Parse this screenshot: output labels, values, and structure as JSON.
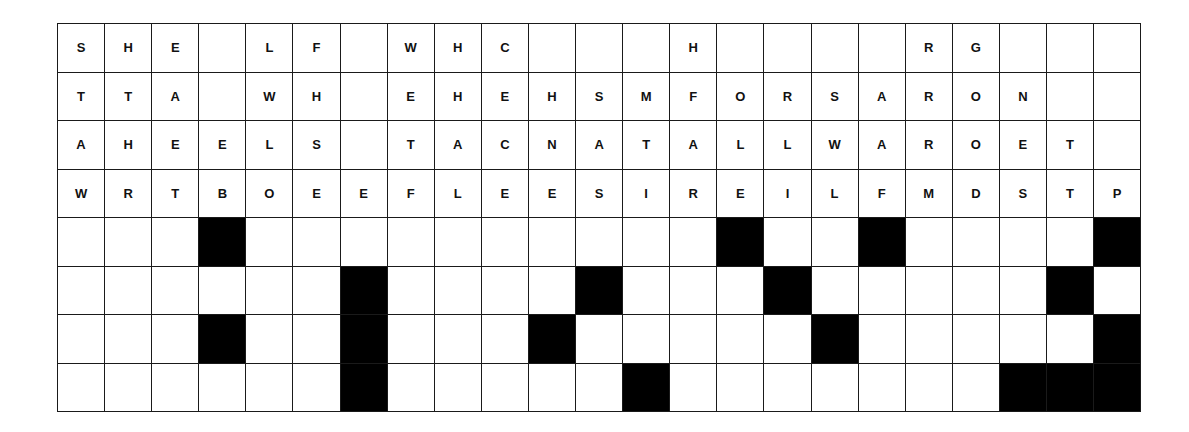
{
  "puzzle": {
    "type": "drop-quote",
    "columns": 23,
    "rows": 8,
    "colors": {
      "grid_line": "#1a1a1a",
      "black_cell": "#000000",
      "white_cell": "#ffffff",
      "letter": "#111111"
    },
    "letter_rows": [
      [
        "S",
        "H",
        "E",
        "",
        "L",
        "F",
        "",
        "W",
        "H",
        "C",
        "",
        "",
        "",
        "H",
        "",
        "",
        "",
        "",
        "R",
        "G",
        "",
        "",
        ""
      ],
      [
        "T",
        "T",
        "A",
        "",
        "W",
        "H",
        "",
        "E",
        "H",
        "E",
        "H",
        "S",
        "M",
        "F",
        "O",
        "R",
        "S",
        "A",
        "R",
        "O",
        "N",
        "",
        ""
      ],
      [
        "A",
        "H",
        "E",
        "E",
        "L",
        "S",
        "",
        "T",
        "A",
        "C",
        "N",
        "A",
        "T",
        "A",
        "L",
        "L",
        "W",
        "A",
        "R",
        "O",
        "E",
        "T",
        ""
      ],
      [
        "W",
        "R",
        "T",
        "B",
        "O",
        "E",
        "E",
        "F",
        "L",
        "E",
        "E",
        "S",
        "I",
        "R",
        "E",
        "I",
        "L",
        "F",
        "M",
        "D",
        "S",
        "T",
        "P"
      ]
    ],
    "answer_rows": [
      {
        "row": 4,
        "black_columns": [
          3,
          14,
          17,
          22
        ]
      },
      {
        "row": 5,
        "black_columns": [
          6,
          11,
          15,
          21
        ]
      },
      {
        "row": 6,
        "black_columns": [
          3,
          6,
          10,
          16,
          22
        ]
      },
      {
        "row": 7,
        "black_columns": [
          6,
          12,
          20,
          21,
          22
        ]
      }
    ]
  }
}
